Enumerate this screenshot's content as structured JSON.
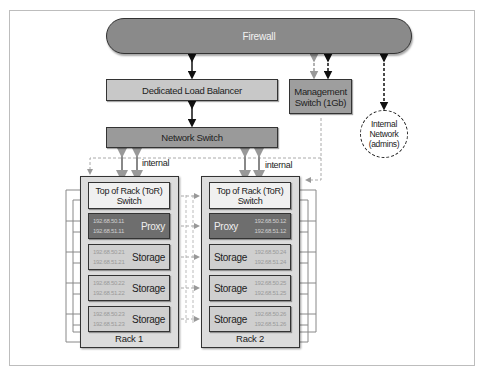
{
  "diagram": {
    "firewall": {
      "label": "Firewall"
    },
    "load_balancer": {
      "label": "Dedicated Load Balancer"
    },
    "management_switch": {
      "line1": "Management",
      "line2": "Switch (1Gb)"
    },
    "network_switch": {
      "label": "Network Switch"
    },
    "internal_network": {
      "line1": "Internal",
      "line2": "Network",
      "line3": "(admins)"
    },
    "link_labels": {
      "rack1_internal": "internal",
      "rack2_internal": "internal"
    },
    "racks": [
      {
        "label": "Rack 1",
        "tor": {
          "line1": "Top of Rack (ToR)",
          "line2": "Switch"
        },
        "nodes": [
          {
            "type": "Proxy",
            "ip1": "192.68.50.11",
            "ip2": "192.68.51.11"
          },
          {
            "type": "Storage",
            "ip1": "192.68.50.21",
            "ip2": "192.68.51.21"
          },
          {
            "type": "Storage",
            "ip1": "192.68.50.22",
            "ip2": "192.68.51.22"
          },
          {
            "type": "Storage",
            "ip1": "192.68.50.23",
            "ip2": "192.68.51.23"
          }
        ]
      },
      {
        "label": "Rack 2",
        "tor": {
          "line1": "Top of Rack (ToR)",
          "line2": "Switch"
        },
        "nodes": [
          {
            "type": "Proxy",
            "ip1": "192.68.50.12",
            "ip2": "192.68.51.12"
          },
          {
            "type": "Storage",
            "ip1": "192.68.50.24",
            "ip2": "192.68.51.24"
          },
          {
            "type": "Storage",
            "ip1": "192.68.50.25",
            "ip2": "192.68.51.25"
          },
          {
            "type": "Storage",
            "ip1": "192.68.50.26",
            "ip2": "192.68.51.26"
          }
        ]
      }
    ],
    "colors": {
      "firewall": "#8a8a8a",
      "load_balancer": "#c8c8c8",
      "management_switch": "#9e9e9e",
      "network_switch": "#9a9a9a",
      "rack_bg": "#dcdcdc",
      "proxy_node": "#6e6e6e",
      "storage_node": "#cfcfcf",
      "tor_switch": "#f0f0f0"
    }
  }
}
